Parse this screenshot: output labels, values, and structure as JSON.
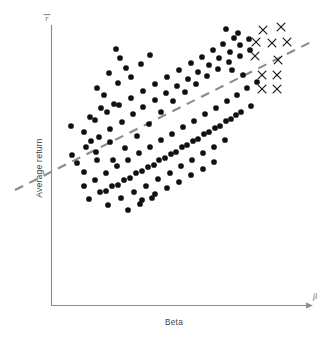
{
  "figure": {
    "width": 329,
    "height": 338,
    "background": "#ffffff"
  },
  "labels": {
    "y_axis_caption": "Average return",
    "x_axis_caption": "Beta",
    "y_axis_symbol": "r̄",
    "x_axis_symbol": "β"
  },
  "colors": {
    "dot": "#111111",
    "x_marker": "#1a1a1a",
    "regression_line": "#8a8a8a",
    "axis": "#8c8c8c",
    "text": "#3f3f3f"
  },
  "chart_data": {
    "type": "scatter",
    "title": "",
    "subtitle": "",
    "xlabel": "Beta",
    "ylabel": "Average return",
    "xlabel_symbol": "β",
    "ylabel_symbol": "r̄",
    "grid": false,
    "legend": "none",
    "axis_ticks": false,
    "xlim": [
      0,
      1
    ],
    "ylim": [
      0,
      1
    ],
    "annotations": [
      "Positively sloped dashed regression line fitted through the cloud",
      "Cross markers in the upper right denote a distinct subgroup of high-beta observations"
    ],
    "series": [
      {
        "name": "observations",
        "marker": "filled-circle",
        "color": "#111111",
        "points": [
          [
            84,
            172
          ],
          [
            77,
            163
          ],
          [
            96,
            152
          ],
          [
            91,
            141
          ],
          [
            84,
            132
          ],
          [
            71,
            126
          ],
          [
            90,
            117
          ],
          [
            101,
            108
          ],
          [
            114,
            104
          ],
          [
            104,
            95
          ],
          [
            97,
            88
          ],
          [
            118,
            83
          ],
          [
            131,
            77
          ],
          [
            109,
            73
          ],
          [
            126,
            68
          ],
          [
            141,
            64
          ],
          [
            120,
            58
          ],
          [
            150,
            55
          ],
          [
            116,
            49
          ],
          [
            72,
            155
          ],
          [
            86,
            147
          ],
          [
            99,
            137
          ],
          [
            110,
            129
          ],
          [
            122,
            122
          ],
          [
            133,
            114
          ],
          [
            143,
            107
          ],
          [
            155,
            100
          ],
          [
            166,
            93
          ],
          [
            177,
            86
          ],
          [
            188,
            79
          ],
          [
            198,
            72
          ],
          [
            209,
            65
          ],
          [
            219,
            58
          ],
          [
            230,
            52
          ],
          [
            240,
            45
          ],
          [
            249,
            39
          ],
          [
            238,
            33
          ],
          [
            226,
            29
          ],
          [
            95,
            180
          ],
          [
            106,
            173
          ],
          [
            117,
            166
          ],
          [
            128,
            160
          ],
          [
            139,
            153
          ],
          [
            150,
            147
          ],
          [
            161,
            140
          ],
          [
            172,
            134
          ],
          [
            183,
            127
          ],
          [
            194,
            121
          ],
          [
            205,
            114
          ],
          [
            216,
            108
          ],
          [
            227,
            101
          ],
          [
            237,
            95
          ],
          [
            247,
            88
          ],
          [
            257,
            82
          ],
          [
            243,
            75
          ],
          [
            232,
            70
          ],
          [
            106,
            191
          ],
          [
            118,
            185
          ],
          [
            130,
            178
          ],
          [
            142,
            171
          ],
          [
            154,
            165
          ],
          [
            165,
            158
          ],
          [
            176,
            152
          ],
          [
            187,
            145
          ],
          [
            198,
            139
          ],
          [
            209,
            132
          ],
          [
            220,
            126
          ],
          [
            231,
            119
          ],
          [
            241,
            112
          ],
          [
            251,
            106
          ],
          [
            89,
            199
          ],
          [
            100,
            192
          ],
          [
            112,
            186
          ],
          [
            124,
            180
          ],
          [
            136,
            173
          ],
          [
            148,
            167
          ],
          [
            159,
            160
          ],
          [
            171,
            154
          ],
          [
            182,
            147
          ],
          [
            193,
            141
          ],
          [
            204,
            134
          ],
          [
            215,
            128
          ],
          [
            226,
            121
          ],
          [
            236,
            115
          ],
          [
            108,
            205
          ],
          [
            121,
            198
          ],
          [
            134,
            192
          ],
          [
            146,
            186
          ],
          [
            158,
            179
          ],
          [
            170,
            173
          ],
          [
            181,
            166
          ],
          [
            192,
            160
          ],
          [
            203,
            153
          ],
          [
            214,
            147
          ],
          [
            225,
            140
          ],
          [
            113,
            160
          ],
          [
            125,
            148
          ],
          [
            137,
            136
          ],
          [
            149,
            124
          ],
          [
            161,
            112
          ],
          [
            173,
            101
          ],
          [
            185,
            92
          ],
          [
            196,
            84
          ],
          [
            207,
            76
          ],
          [
            218,
            69
          ],
          [
            229,
            62
          ],
          [
            240,
            56
          ],
          [
            250,
            50
          ],
          [
            95,
            120
          ],
          [
            107,
            112
          ],
          [
            119,
            105
          ],
          [
            131,
            98
          ],
          [
            143,
            91
          ],
          [
            155,
            84
          ],
          [
            167,
            77
          ],
          [
            179,
            70
          ],
          [
            191,
            63
          ],
          [
            202,
            57
          ],
          [
            213,
            50
          ],
          [
            223,
            44
          ],
          [
            234,
            38
          ],
          [
            142,
            200
          ],
          [
            155,
            194
          ],
          [
            167,
            188
          ],
          [
            179,
            182
          ],
          [
            191,
            175
          ],
          [
            203,
            169
          ],
          [
            214,
            162
          ],
          [
            128,
            210
          ],
          [
            140,
            204
          ],
          [
            152,
            198
          ],
          [
            84,
            186
          ],
          [
            97,
            160
          ],
          [
            110,
            142
          ]
        ]
      },
      {
        "name": "high-beta-subgroup",
        "marker": "cross",
        "color": "#1a1a1a",
        "points": [
          [
            263,
            30
          ],
          [
            281,
            27
          ],
          [
            256,
            42
          ],
          [
            272,
            43
          ],
          [
            287,
            42
          ],
          [
            255,
            56
          ],
          [
            278,
            60
          ],
          [
            262,
            75
          ],
          [
            277,
            75
          ],
          [
            262,
            89
          ],
          [
            277,
            89
          ]
        ]
      }
    ],
    "fit_line": {
      "name": "security-market-line",
      "style": "dashed",
      "color": "#8a8a8a",
      "x1": 15,
      "y1": 190,
      "x2": 313,
      "y2": 41
    }
  }
}
